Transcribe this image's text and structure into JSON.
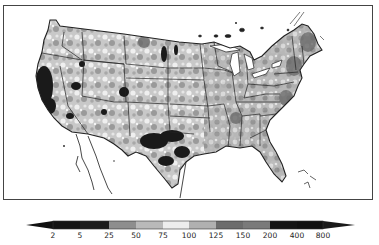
{
  "map": {
    "region": "Contiguous United States",
    "style": "grayscale choropleth with state boundaries",
    "notable_features": [
      {
        "name": "california-coast-dark",
        "shade": "very low"
      },
      {
        "name": "texas-central-dark",
        "shade": "very low"
      },
      {
        "name": "new-england-medium-dark",
        "shade": "high"
      },
      {
        "name": "southeast-light-medium",
        "shade": "near normal"
      }
    ]
  },
  "legend": {
    "type": "colorbar",
    "orientation": "horizontal",
    "extend": "both",
    "ticks": [
      "2",
      "5",
      "25",
      "50",
      "75",
      "100",
      "125",
      "150",
      "200",
      "400",
      "800"
    ],
    "segments": [
      {
        "from": "<2",
        "color": "#111111"
      },
      {
        "from": "2",
        "to": "5",
        "color": "#141414"
      },
      {
        "from": "5",
        "to": "25",
        "color": "#1c1c1c"
      },
      {
        "from": "25",
        "to": "50",
        "color": "#8e8e8e"
      },
      {
        "from": "50",
        "to": "75",
        "color": "#b9b9b9"
      },
      {
        "from": "75",
        "to": "100",
        "color": "#ededed"
      },
      {
        "from": "100",
        "to": "125",
        "color": "#b0b0b0"
      },
      {
        "from": "125",
        "to": "150",
        "color": "#6c6c6c"
      },
      {
        "from": "150",
        "to": "200",
        "color": "#7a7a7a"
      },
      {
        "from": "200",
        "to": "400",
        "color": "#151515"
      },
      {
        "from": "400",
        "to": "800",
        "color": "#111111"
      },
      {
        "from": ">800",
        "color": "#1a1a1a"
      }
    ]
  }
}
